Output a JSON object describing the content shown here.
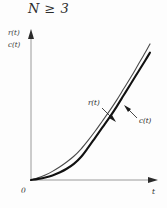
{
  "chart_data": {
    "type": "line",
    "title": "N ≥ 3",
    "xlabel": "t",
    "ylabel": "r(t)\nc(t)",
    "ylabel_lines": [
      "r(t)",
      "c(t)"
    ],
    "origin_label": "0",
    "grid": false,
    "legend": "inline-annotations",
    "xlim": [
      0,
      1
    ],
    "ylim": [
      0,
      1
    ],
    "axis_ticks": [],
    "series": [
      {
        "name": "r(t)",
        "style": "thin",
        "annotation": "r(t)",
        "x": [
          0.0,
          0.06,
          0.12,
          0.18,
          0.24,
          0.3,
          0.36,
          0.42,
          0.48,
          0.54,
          0.6,
          0.66,
          0.72,
          0.78,
          0.84,
          0.9,
          0.96,
          1.0
        ],
        "y": [
          0.0,
          0.015,
          0.035,
          0.06,
          0.09,
          0.125,
          0.165,
          0.215,
          0.275,
          0.34,
          0.41,
          0.48,
          0.555,
          0.635,
          0.715,
          0.8,
          0.885,
          0.945
        ]
      },
      {
        "name": "c(t)",
        "style": "thick",
        "annotation": "c(t)",
        "x": [
          0.0,
          0.06,
          0.12,
          0.18,
          0.24,
          0.3,
          0.36,
          0.42,
          0.48,
          0.54,
          0.6,
          0.66,
          0.72,
          0.78,
          0.84,
          0.9,
          0.96,
          1.0
        ],
        "y": [
          0.0,
          0.008,
          0.018,
          0.032,
          0.052,
          0.078,
          0.112,
          0.16,
          0.225,
          0.295,
          0.365,
          0.435,
          0.51,
          0.59,
          0.67,
          0.75,
          0.83,
          0.885
        ]
      }
    ],
    "colors": {
      "curve_r": "#4a4a4a",
      "curve_c": "#111111",
      "axis": "#9a9a9a",
      "text": "#2b2b2b",
      "background": "#fdfdfd"
    }
  }
}
